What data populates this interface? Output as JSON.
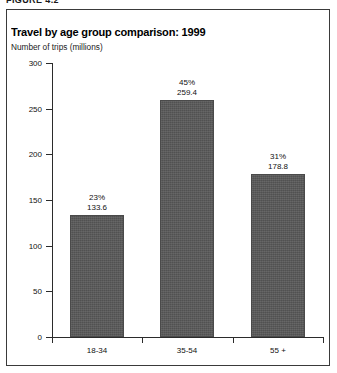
{
  "figure": {
    "caption": "FIGURE 4.2"
  },
  "chart_header": {
    "title": "Travel by age group comparison: 1999",
    "subtitle": "Number of trips (millions)"
  },
  "chart_data": {
    "type": "bar",
    "title": "Travel by age group comparison: 1999",
    "subtitle": "Number of trips (millions)",
    "xlabel": "",
    "ylabel": "Number of trips (millions)",
    "categories": [
      "18-34",
      "35-54",
      "55 +"
    ],
    "values": [
      133.6,
      259.4,
      178.8
    ],
    "value_labels": [
      "133.6",
      "259.4",
      "178.8"
    ],
    "percent_labels": [
      "23%",
      "45%",
      "31%"
    ],
    "percents": [
      23,
      45,
      31
    ],
    "ylim": [
      0,
      300
    ],
    "ytick_values": [
      0,
      50,
      100,
      150,
      200,
      250,
      300
    ],
    "ytick_labels": [
      "0",
      "50",
      "100",
      "150",
      "200",
      "250",
      "300"
    ],
    "grid": false,
    "legend": false,
    "bar_color": "#585858",
    "axis_color": "#2b2b2b"
  }
}
